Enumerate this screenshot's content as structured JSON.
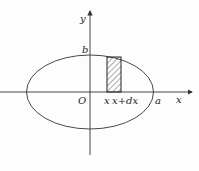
{
  "diagram": {
    "labels": {
      "y_axis": "y",
      "x_axis": "x",
      "origin": "O",
      "b": "b",
      "a": "a",
      "strip_left": "x",
      "strip_right": "x+dx"
    },
    "colors": {
      "stroke": "#333333",
      "hatch": "#444444"
    }
  }
}
